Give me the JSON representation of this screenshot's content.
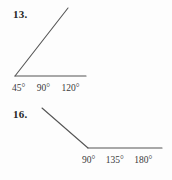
{
  "page": {
    "background_color": "#fdfdfd",
    "ink_color": "#555555",
    "text_color": "#2b2b2b"
  },
  "problems": [
    {
      "number": "13.",
      "figure": {
        "type": "acute-angle",
        "description": "An angle with a horizontal ray pointing right and a second ray slanting up and to the right from a shared vertex at lower left",
        "vertex": {
          "x": 15,
          "y": 76
        },
        "rays": [
          {
            "name": "horizontal-ray",
            "to": {
              "x": 86,
              "y": 76
            }
          },
          {
            "name": "slanted-ray",
            "to": {
              "x": 68,
              "y": 8
            }
          }
        ],
        "approx_measure_degrees": 44
      },
      "choices": [
        {
          "label": "45°",
          "value": 45
        },
        {
          "label": "90°",
          "value": 90
        },
        {
          "label": "120°",
          "value": 120
        }
      ]
    },
    {
      "number": "16.",
      "figure": {
        "type": "obtuse-angle",
        "description": "An angle with a horizontal ray pointing right and a second ray slanting up and to the left from a shared vertex at lower middle",
        "vertex": {
          "x": 88,
          "y": 148
        },
        "rays": [
          {
            "name": "horizontal-ray",
            "to": {
              "x": 162,
              "y": 148
            }
          },
          {
            "name": "slanted-ray",
            "to": {
              "x": 42,
              "y": 108
            }
          }
        ],
        "approx_measure_degrees": 139
      },
      "choices": [
        {
          "label": "90°",
          "value": 90
        },
        {
          "label": "135°",
          "value": 135
        },
        {
          "label": "180°",
          "value": 180
        }
      ]
    }
  ]
}
